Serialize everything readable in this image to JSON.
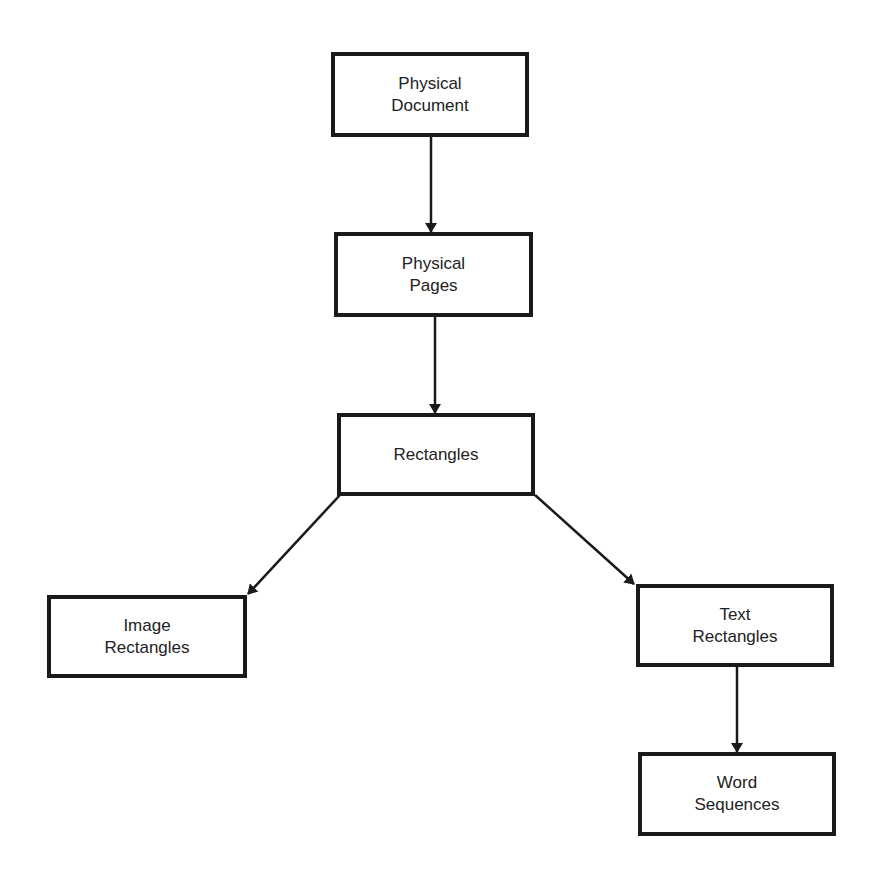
{
  "diagram": {
    "type": "hierarchy",
    "nodes": [
      {
        "id": "physical-document",
        "lines": [
          "Physical",
          "Document"
        ],
        "x": 331,
        "y": 52,
        "w": 198,
        "h": 85
      },
      {
        "id": "physical-pages",
        "lines": [
          "Physical",
          "Pages"
        ],
        "x": 334,
        "y": 232,
        "w": 199,
        "h": 85
      },
      {
        "id": "rectangles",
        "lines": [
          "Rectangles"
        ],
        "x": 337,
        "y": 413,
        "w": 198,
        "h": 83
      },
      {
        "id": "image-rectangles",
        "lines": [
          "Image",
          "Rectangles"
        ],
        "x": 47,
        "y": 595,
        "w": 200,
        "h": 83
      },
      {
        "id": "text-rectangles",
        "lines": [
          "Text",
          "Rectangles"
        ],
        "x": 636,
        "y": 584,
        "w": 198,
        "h": 83
      },
      {
        "id": "word-sequences",
        "lines": [
          "Word",
          "Sequences"
        ],
        "x": 638,
        "y": 752,
        "w": 198,
        "h": 84
      }
    ],
    "edges": [
      {
        "from": "physical-document",
        "to": "physical-pages",
        "x1": 431,
        "y1": 137,
        "x2": 431,
        "y2": 232
      },
      {
        "from": "physical-pages",
        "to": "rectangles",
        "x1": 435,
        "y1": 317,
        "x2": 435,
        "y2": 413
      },
      {
        "from": "rectangles",
        "to": "image-rectangles",
        "x1": 340,
        "y1": 495,
        "x2": 248,
        "y2": 594
      },
      {
        "from": "rectangles",
        "to": "text-rectangles",
        "x1": 535,
        "y1": 495,
        "x2": 634,
        "y2": 584
      },
      {
        "from": "text-rectangles",
        "to": "word-sequences",
        "x1": 737,
        "y1": 667,
        "x2": 737,
        "y2": 752
      }
    ],
    "colors": {
      "stroke": "#1a1a1a",
      "text": "#222222",
      "background": "#ffffff"
    }
  }
}
